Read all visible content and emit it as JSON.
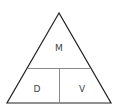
{
  "diagram": {
    "type": "formula-triangle",
    "top_label": "M",
    "bottom_left_label": "D",
    "bottom_right_label": "V",
    "colors": {
      "outline": "#222222",
      "divider": "#8a8a8a",
      "text": "#444444",
      "background": "#ffffff"
    }
  }
}
